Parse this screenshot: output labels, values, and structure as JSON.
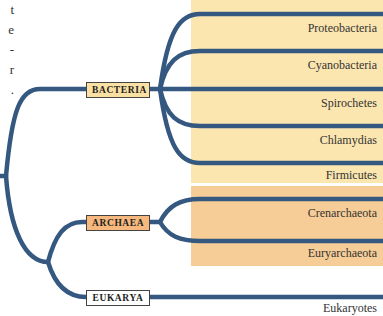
{
  "margin_fragments": [
    "t",
    "e",
    "-",
    "r",
    "."
  ],
  "colors": {
    "branch": "#34587f",
    "bacteria_bg": "#fbe6b0",
    "archaea_bg": "#f7cd97",
    "bacteria_label_bg": "#fbe0a3",
    "archaea_label_bg": "#f6b87c",
    "eukarya_label_bg": "#ffffff"
  },
  "domains": [
    {
      "label": "BACTERIA",
      "groups": [
        "Proteobacteria",
        "Cyanobacteria",
        "Spirochetes",
        "Chlamydias",
        "Firmicutes"
      ]
    },
    {
      "label": "ARCHAEA",
      "groups": [
        "Crenarchaeota",
        "Euryarchaeota"
      ]
    },
    {
      "label": "EUKARYA",
      "groups": [
        "Eukaryotes"
      ]
    }
  ]
}
